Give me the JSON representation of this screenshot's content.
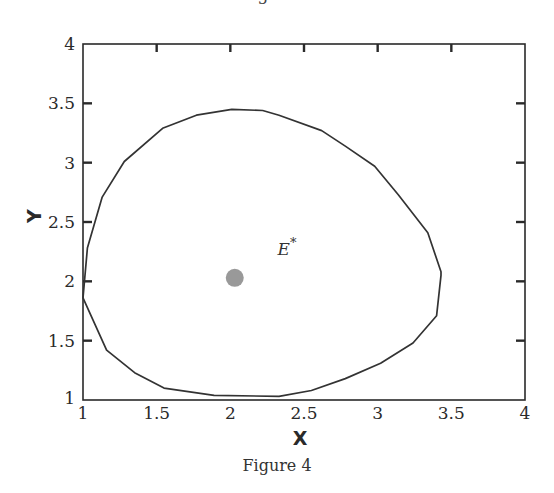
{
  "page": {
    "top_caption": "Figure 3",
    "caption": "Figure 4"
  },
  "chart_data": {
    "type": "line",
    "title": "",
    "xlabel": "X",
    "ylabel": "Y",
    "xlim": [
      1,
      4
    ],
    "ylim": [
      1,
      4
    ],
    "xticks": [
      "1",
      "1.5",
      "2",
      "2.5",
      "3",
      "3.5",
      "4"
    ],
    "yticks": [
      "1",
      "1.5",
      "2",
      "2.5",
      "3",
      "3.5",
      "4"
    ],
    "grid": false,
    "series": [
      {
        "name": "closed orbit (limit cycle)",
        "closed": true,
        "x": [
          2.01,
          2.22,
          2.33,
          2.62,
          2.78,
          2.98,
          3.14,
          3.34,
          3.43,
          3.43,
          3.4,
          3.24,
          3.02,
          2.78,
          2.55,
          2.33,
          1.89,
          1.55,
          1.35,
          1.16,
          1.0,
          1.03,
          1.13,
          1.28,
          1.54,
          1.77
        ],
        "y": [
          3.45,
          3.44,
          3.4,
          3.27,
          3.14,
          2.97,
          2.73,
          2.41,
          2.08,
          2.05,
          1.71,
          1.48,
          1.31,
          1.18,
          1.08,
          1.03,
          1.04,
          1.1,
          1.23,
          1.42,
          1.86,
          2.28,
          2.71,
          3.01,
          3.29,
          3.4
        ]
      }
    ],
    "points": [
      {
        "label": "E*",
        "x": 2.03,
        "y": 2.03,
        "color": "#999999"
      }
    ],
    "annotations": [
      {
        "text": "E",
        "superscript": "*",
        "x": 2.32,
        "y": 2.22
      }
    ]
  }
}
